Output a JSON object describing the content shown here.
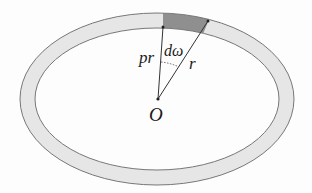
{
  "diagram": {
    "type": "elliptical-ring-sector",
    "colors": {
      "ring_fill": "#e6e6e6",
      "ring_stroke": "#777777",
      "sector_fill": "#8f8f8f",
      "line": "#333333",
      "background": "#fdfdfd"
    },
    "labels": {
      "origin": "O",
      "inner_radius": "pr",
      "angle": "dω",
      "outer_radius": "r"
    },
    "elements": [
      "outer ellipse",
      "inner ellipse",
      "shaded ring sector",
      "radius line to inner edge (pr)",
      "radius line to outer edge (r)",
      "dotted angle arc (dω)",
      "origin point O"
    ]
  }
}
